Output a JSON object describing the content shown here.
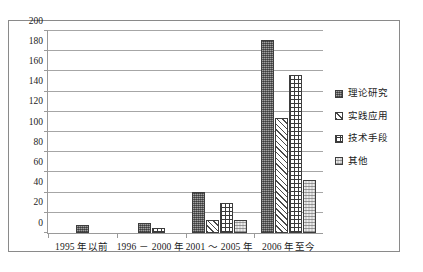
{
  "chart_data": {
    "type": "bar",
    "title": "",
    "subtitle": "",
    "xlabel": "",
    "ylabel": "",
    "ylim": [
      0,
      200
    ],
    "ytick_step": 20,
    "yticks": [
      0,
      20,
      40,
      60,
      80,
      100,
      120,
      140,
      160,
      180,
      200
    ],
    "grid": true,
    "legend_position": "right",
    "categories": [
      "1995 年以前",
      "1996 － 2000 年",
      "2001 ～ 2005 年",
      "2006 年至今"
    ],
    "series": [
      {
        "name": "理论研究",
        "values": [
          8,
          10,
          41,
          191
        ]
      },
      {
        "name": "实践应用",
        "values": [
          0,
          0,
          13,
          114
        ]
      },
      {
        "name": "技术手段",
        "values": [
          0,
          5,
          30,
          156
        ]
      },
      {
        "name": "其他",
        "values": [
          0,
          0,
          13,
          52
        ]
      }
    ]
  },
  "legend": {
    "items": [
      {
        "label": "理论研究",
        "swatch": "dark-speckle-swatch"
      },
      {
        "label": "实践应用",
        "swatch": "diagonal-hatch-swatch"
      },
      {
        "label": "技术手段",
        "swatch": "cross-grid-swatch"
      },
      {
        "label": "其他",
        "swatch": "light-dotted-swatch"
      }
    ]
  },
  "colors": {
    "series_theory": "#6d6d6d",
    "series_practice": "#ffffff",
    "series_technique": "#ffffff",
    "series_other": "#d3d3d3",
    "gridline": "#a6a6a6",
    "axis": "#9a9a9a",
    "frame": "#8a8a8a",
    "text": "#1a1a1a",
    "background": "#ffffff"
  }
}
